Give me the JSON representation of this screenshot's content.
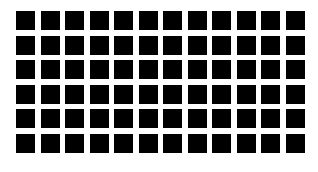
{
  "grid": {
    "rows": 6,
    "columns": 12,
    "cell_color": "#000000",
    "background_color": "#ffffff"
  }
}
